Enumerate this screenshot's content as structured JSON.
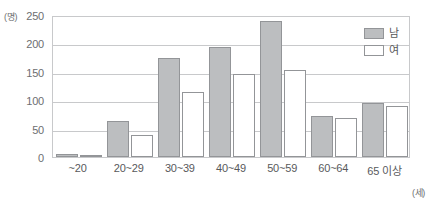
{
  "chart_data": {
    "type": "bar",
    "title": "",
    "xlabel": "(세)",
    "ylabel": "(명)",
    "ylim": [
      0,
      250
    ],
    "yticks": [
      0,
      50,
      100,
      150,
      200,
      250
    ],
    "grid": true,
    "legend_position": "top-right",
    "categories": [
      "~20",
      "20~29",
      "30~39",
      "40~49",
      "50~59",
      "60~64",
      "65 이상"
    ],
    "series": [
      {
        "name": "남",
        "color": "#bcbec0",
        "values": [
          5,
          63,
          174,
          193,
          239,
          72,
          95
        ]
      },
      {
        "name": "여",
        "color": "#ffffff",
        "values": [
          3,
          38,
          115,
          146,
          154,
          68,
          89
        ]
      }
    ]
  },
  "axis": {
    "y_unit": "(명)",
    "x_unit": "(세)"
  },
  "legend": {
    "items": [
      {
        "label": "남",
        "swatch": "male-swatch"
      },
      {
        "label": "여",
        "swatch": "female-swatch"
      }
    ]
  }
}
